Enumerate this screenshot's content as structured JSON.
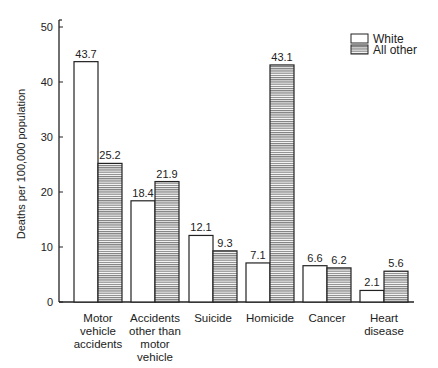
{
  "chart_data": {
    "type": "bar",
    "title": "",
    "xlabel": "",
    "ylabel": "Deaths per 100,000 population",
    "ylim": [
      0,
      50
    ],
    "yticks": [
      0,
      10,
      20,
      30,
      40,
      50
    ],
    "grid": false,
    "legend_position": "top-right",
    "categories": [
      [
        "Motor",
        "vehicle",
        "accidents"
      ],
      [
        "Accidents",
        "other than",
        "motor",
        "vehicle"
      ],
      [
        "Suicide"
      ],
      [
        "Homicide"
      ],
      [
        "Cancer"
      ],
      [
        "Heart",
        "disease"
      ]
    ],
    "category_names": [
      "Motor vehicle accidents",
      "Accidents other than motor vehicle",
      "Suicide",
      "Homicide",
      "Cancer",
      "Heart disease"
    ],
    "series": [
      {
        "name": "White",
        "fill": "plain",
        "values": [
          43.7,
          18.4,
          12.1,
          7.1,
          6.6,
          2.1
        ],
        "labels": [
          "43.7",
          "18.4",
          "12.1",
          "7.1",
          "6.6",
          "2.1"
        ]
      },
      {
        "name": "All other",
        "fill": "hatched",
        "values": [
          25.2,
          21.9,
          9.3,
          43.1,
          6.2,
          5.6
        ],
        "labels": [
          "25.2",
          "21.9",
          "9.3",
          "43.1",
          "6.2",
          "5.6"
        ]
      }
    ]
  },
  "colors": {
    "ink": "#222222",
    "background": "#ffffff",
    "hatch": "#555555"
  }
}
